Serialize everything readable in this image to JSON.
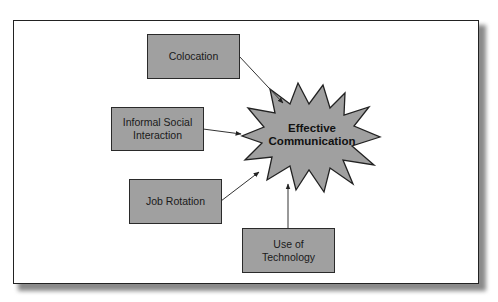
{
  "diagram": {
    "center": {
      "label_line1": "Effective",
      "label_line2": "Communication",
      "shape": "starburst",
      "fill": "#a0a0a0"
    },
    "factors": [
      {
        "id": "colocation",
        "label_line1": "Colocation",
        "label_line2": ""
      },
      {
        "id": "informal-social-interaction",
        "label_line1": "Informal Social",
        "label_line2": "Interaction"
      },
      {
        "id": "job-rotation",
        "label_line1": "Job Rotation",
        "label_line2": ""
      },
      {
        "id": "use-of-technology",
        "label_line1": "Use of",
        "label_line2": "Technology"
      }
    ],
    "edges": [
      {
        "from": "colocation",
        "to": "center"
      },
      {
        "from": "informal-social-interaction",
        "to": "center"
      },
      {
        "from": "job-rotation",
        "to": "center"
      },
      {
        "from": "use-of-technology",
        "to": "center"
      }
    ],
    "colors": {
      "box_fill": "#a0a0a0",
      "border": "#2a2a2a",
      "frame_border": "#222222",
      "shadow": "#8a8a8a"
    }
  }
}
